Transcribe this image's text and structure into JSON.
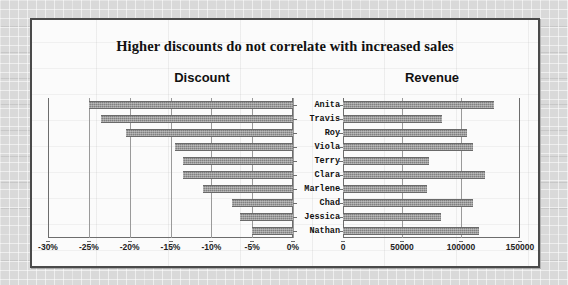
{
  "chart_title": "Higher discounts do not  correlate with  increased sales",
  "panels": {
    "left_heading": "Discount",
    "right_heading": "Revenue"
  },
  "chart_data": {
    "type": "bar",
    "title": "Higher discounts do not  correlate with  increased sales",
    "orientation": "horizontal",
    "layout": "tornado / butterfly — two mirrored horizontal bar panels sharing one category axis",
    "categories": [
      "Anita",
      "Travis",
      "Roy",
      "Viola",
      "Terry",
      "Clara",
      "Marlene",
      "Chad",
      "Jessica",
      "Nathan"
    ],
    "series": [
      {
        "name": "Discount",
        "panel": "left",
        "direction": "right-to-left",
        "values": [
          -0.25,
          -0.235,
          -0.205,
          -0.145,
          -0.135,
          -0.135,
          -0.11,
          -0.075,
          -0.065,
          -0.05
        ],
        "value_labels": [
          "-25%",
          "-23.5%",
          "-20.5%",
          "-14.5%",
          "-13.5%",
          "-13.5%",
          "-11%",
          "-7.5%",
          "-6.5%",
          "-5%"
        ],
        "axis": {
          "ticks": [
            -0.3,
            -0.25,
            -0.2,
            -0.15,
            -0.1,
            -0.05,
            0
          ],
          "tick_labels": [
            "-30%",
            "-25%",
            "-20%",
            "-15%",
            "-10%",
            "-5%",
            "0%"
          ],
          "min": -0.3,
          "max": 0,
          "format": "percent"
        }
      },
      {
        "name": "Revenue",
        "panel": "right",
        "direction": "left-to-right",
        "values": [
          128000,
          84000,
          105000,
          110000,
          73000,
          120000,
          71000,
          110000,
          83000,
          115000
        ],
        "axis": {
          "ticks": [
            0,
            50000,
            100000,
            150000
          ],
          "tick_labels": [
            "0",
            "50000",
            "100000",
            "150000"
          ],
          "min": 0,
          "max": 150000,
          "format": "number"
        }
      }
    ],
    "grid": true,
    "legend": "none",
    "colors": {
      "bar": "#808080",
      "plot_background": "#fbfbfb",
      "frame_border": "#4a4a4a",
      "gridline": "#9a9a9a",
      "page_background": "#d8d8d8",
      "text": "#111111"
    }
  }
}
